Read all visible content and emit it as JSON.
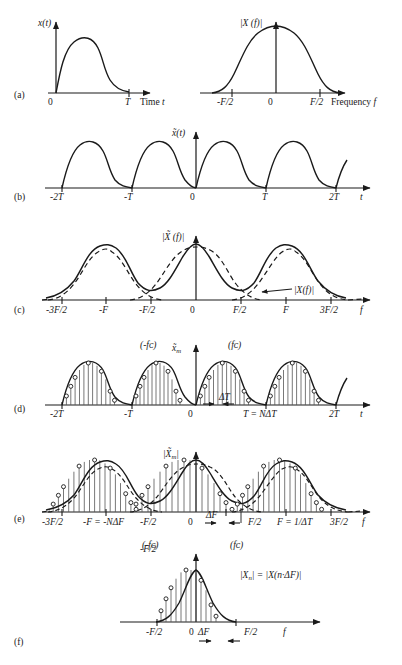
{
  "figure": {
    "title_present": false,
    "background": "#ffffff",
    "ink": "#1a1a1a",
    "panels": [
      {
        "id": "a",
        "label": "(a)",
        "plots": [
          {
            "name": "time-domain-continuous",
            "ylabel": "x(t)",
            "xlabel": "Time t",
            "xticks": [
              "0",
              "T"
            ],
            "curve": "single smooth pulse rising from 0, flat-topped, decaying to 0 at T"
          },
          {
            "name": "frequency-domain-continuous",
            "ylabel": "|X (f)|",
            "xlabel": "Frequency f",
            "xticks": [
              "-F/2",
              "0",
              "F/2"
            ],
            "curve": "single bell-shaped magnitude spectrum centered at 0"
          }
        ]
      },
      {
        "id": "b",
        "label": "(b)",
        "plots": [
          {
            "name": "time-domain-periodic",
            "ylabel": "x̃(t)",
            "xlabel": "t",
            "xticks": [
              "-2T",
              "-T",
              "0",
              "T",
              "2T"
            ],
            "curve": "periodic repetition of the pulse with period T"
          }
        ]
      },
      {
        "id": "c",
        "label": "(c)",
        "plots": [
          {
            "name": "frequency-domain-periodic",
            "ylabel": "|X̃ (f)|",
            "xlabel": "f",
            "xticks": [
              "-3F/2",
              "-F",
              "-F/2",
              "0",
              "F/2",
              "F",
              "3F/2"
            ],
            "annotation": "|X(f)|",
            "curve": "solid aliased sum of overlapping dashed replicas spaced by F"
          }
        ]
      },
      {
        "id": "d",
        "label": "(d)",
        "plots": [
          {
            "name": "time-domain-sampled",
            "ylabel": "x̃ₘ",
            "xlabel": "t",
            "xticks": [
              "-2T",
              "-T",
              "0",
              "T = NΔT",
              "2T"
            ],
            "spacing_label": "ΔT",
            "left_note": "(-fᴄ)",
            "right_note": "(fᴄ)",
            "curve": "sampled periodic pulse train with stems and open-circle markers"
          }
        ]
      },
      {
        "id": "e",
        "label": "(e)",
        "plots": [
          {
            "name": "frequency-domain-sampled",
            "ylabel": "|X̃ₘ|",
            "xlabel": "f",
            "xticks": [
              "-3F/2",
              "-F = -NΔF",
              "-F/2",
              "0",
              "F/2",
              "F = 1/ΔT",
              "3F/2"
            ],
            "spacing_label": "ΔF",
            "left_note": "(-fᴄ)",
            "right_note": "(fᴄ)",
            "curve": "sampled aliased spectrum, stems with open circles over dashed replicas"
          }
        ]
      },
      {
        "id": "f",
        "label": "(f)",
        "plots": [
          {
            "name": "dft-coefficients",
            "annotation": "|Xₙ| = |X(n·ΔF)|",
            "xlabel": "f",
            "xticks": [
              "-F/2",
              "0",
              "F/2"
            ],
            "spacing_label": "ΔF",
            "curve": "single sampled bell spectrum with stems and open-circle markers"
          }
        ]
      }
    ]
  },
  "chart_data": {
    "type": "line",
    "panels": [
      {
        "panel": "a-left",
        "type": "line",
        "xlabel": "Time t",
        "ylabel": "x(t)",
        "xticks": [
          "0",
          "T"
        ],
        "x": [
          0,
          0.08,
          0.16,
          0.25,
          0.33,
          0.42,
          0.5,
          0.58,
          0.66,
          0.75,
          0.83,
          0.92,
          1.0
        ],
        "y": [
          0.0,
          0.3,
          0.62,
          0.85,
          0.96,
          1.0,
          0.98,
          0.9,
          0.72,
          0.45,
          0.22,
          0.08,
          0.0
        ]
      },
      {
        "panel": "a-right",
        "type": "line",
        "xlabel": "Frequency f",
        "ylabel": "|X (f)|",
        "xticks": [
          "-F/2",
          "0",
          "F/2"
        ],
        "x": [
          -0.5,
          -0.42,
          -0.33,
          -0.25,
          -0.17,
          -0.08,
          0,
          0.08,
          0.17,
          0.25,
          0.33,
          0.42,
          0.5
        ],
        "y": [
          0.0,
          0.08,
          0.22,
          0.42,
          0.66,
          0.88,
          1.0,
          0.88,
          0.66,
          0.42,
          0.22,
          0.08,
          0.0
        ]
      },
      {
        "panel": "b",
        "type": "line",
        "xlabel": "t",
        "ylabel": "x̃(t)",
        "xticks": [
          "-2T",
          "-T",
          "0",
          "T",
          "2T"
        ],
        "period": 1,
        "note": "periodic extension of panel a-left, 4 visible periods from -2T to 2T"
      },
      {
        "panel": "c",
        "type": "line",
        "xlabel": "f",
        "ylabel": "|X̃ (f)|",
        "xticks": [
          "-3F/2",
          "-F",
          "-F/2",
          "0",
          "F/2",
          "F",
          "3F/2"
        ],
        "series": [
          {
            "name": "|X̃ (f)| (solid sum)",
            "peak": 1.0,
            "centers": [
              -1,
              0,
              1
            ],
            "valley": 0.18
          },
          {
            "name": "|X(f)| (dashed replicas)",
            "peak": 0.92,
            "centers": [
              -1,
              0,
              1
            ],
            "valley": 0.0
          }
        ]
      },
      {
        "panel": "d",
        "type": "line",
        "xlabel": "t",
        "ylabel": "x̃ₘ",
        "xticks": [
          "-2T",
          "-T",
          "0",
          "T = NΔT",
          "2T"
        ],
        "sample_spacing": "ΔT",
        "samples_per_period": 16
      },
      {
        "panel": "e",
        "type": "line",
        "xlabel": "f",
        "ylabel": "|X̃ₘ|",
        "xticks": [
          "-3F/2",
          "-F = -NΔF",
          "-F/2",
          "0",
          "F/2",
          "F = 1/ΔT",
          "3F/2"
        ],
        "sample_spacing": "ΔF",
        "samples_per_period": 16
      },
      {
        "panel": "f",
        "type": "line",
        "xlabel": "f",
        "ylabel": "|Xₙ| = |X(n·ΔF)|",
        "xticks": [
          "-F/2",
          "0",
          "F/2"
        ],
        "sample_spacing": "ΔF",
        "samples": 15
      }
    ]
  }
}
